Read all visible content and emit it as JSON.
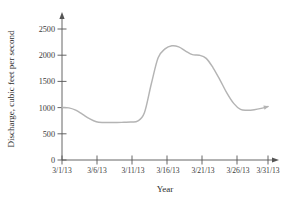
{
  "chart_data": {
    "type": "line",
    "title": "",
    "xlabel": "Year",
    "ylabel": "Discharge, cubic feet per second",
    "x_tick_labels": [
      "3/1/13",
      "3/6/13",
      "3/11/13",
      "3/16/13",
      "3/21/13",
      "3/26/13",
      "3/31/13"
    ],
    "y_tick_labels": [
      "0",
      "500",
      "1000",
      "1500",
      "2000",
      "2500"
    ],
    "y_ticks": [
      0,
      500,
      1000,
      1500,
      2000,
      2500
    ],
    "ylim": [
      0,
      2700
    ],
    "xlim": [
      "3/1/13",
      "3/31/13"
    ],
    "grid": false,
    "legend": false,
    "line_color": "#b4b4b4",
    "axis_color": "#555555",
    "series": [
      {
        "name": "Discharge",
        "x": [
          "3/1/13",
          "3/2/13",
          "3/3/13",
          "3/4/13",
          "3/5/13",
          "3/6/13",
          "3/7/13",
          "3/8/13",
          "3/9/13",
          "3/10/13",
          "3/11/13",
          "3/12/13",
          "3/13/13",
          "3/14/13",
          "3/15/13",
          "3/16/13",
          "3/17/13",
          "3/18/13",
          "3/19/13",
          "3/20/13",
          "3/21/13",
          "3/22/13",
          "3/23/13",
          "3/24/13",
          "3/25/13",
          "3/26/13",
          "3/27/13",
          "3/28/13",
          "3/29/13",
          "3/30/13",
          "3/31/13"
        ],
        "values": [
          1000,
          995,
          950,
          870,
          790,
          730,
          715,
          715,
          715,
          720,
          725,
          740,
          900,
          1450,
          1950,
          2120,
          2180,
          2160,
          2080,
          2010,
          2000,
          1940,
          1760,
          1530,
          1280,
          1080,
          965,
          950,
          960,
          985,
          1020
        ]
      }
    ],
    "annotations": [
      {
        "type": "arrowhead",
        "position": "end-of-line",
        "description": "small arrow at right end of data curve"
      },
      {
        "type": "arrowhead",
        "position": "top-of-y-axis",
        "description": "axis arrow"
      },
      {
        "type": "arrowhead",
        "position": "right-of-x-axis",
        "description": "axis arrow"
      }
    ]
  }
}
